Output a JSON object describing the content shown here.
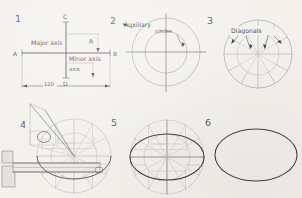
{
  "document": {
    "title": "Ellipse construction by concentric (auxiliary) circles method",
    "medium": "hand-drawn pencil sketch on paper",
    "background_color": "#f3f1ec",
    "line_color": "#6e6e70",
    "ink_color": "#3f3f42"
  },
  "panels": [
    {
      "number": "1",
      "caption": "",
      "labels": {
        "major_axis": "Major axis",
        "minor_axis": "Minor axis",
        "radius": "R",
        "point_a": "A",
        "point_b": "B",
        "point_c": "C",
        "point_d": "D",
        "dimension": "120"
      }
    },
    {
      "number": "2",
      "annotation_main": "Auxiliary",
      "annotation_sub": "circles"
    },
    {
      "number": "3",
      "annotation_main": "Diagonals"
    },
    {
      "number": "4",
      "annotation_main": ""
    },
    {
      "number": "5",
      "annotation_main": ""
    },
    {
      "number": "6",
      "annotation_main": ""
    }
  ],
  "geometry": {
    "major_axis_length": "120",
    "auxiliary_circle_count": 2,
    "diagonal_count": 12
  }
}
